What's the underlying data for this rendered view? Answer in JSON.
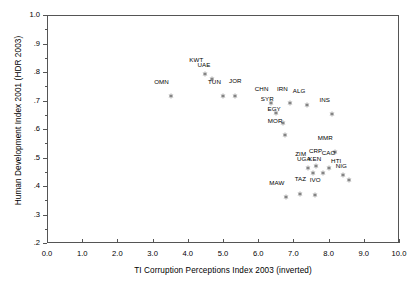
{
  "chart_data": {
    "type": "scatter",
    "title": "",
    "xlabel": "TI Corruption Perceptions Index 2003 (inverted)",
    "ylabel": "Human Development Index 2001 (HDR 2003)",
    "xlim": [
      0.0,
      10.0
    ],
    "ylim": [
      0.2,
      1.0
    ],
    "xticks": [
      "0.0",
      "1.0",
      "2.0",
      "3.0",
      "4.0",
      "5.0",
      "6.0",
      "7.0",
      "8.0",
      "9.0",
      "10.0"
    ],
    "xtick_values": [
      0,
      1,
      2,
      3,
      4,
      5,
      6,
      7,
      8,
      9,
      10
    ],
    "yticks": [
      "1.0",
      ".9",
      ".8",
      ".7",
      ".6",
      ".5",
      ".4",
      ".3",
      ".2"
    ],
    "ytick_values": [
      1.0,
      0.9,
      0.8,
      0.7,
      0.6,
      0.5,
      0.4,
      0.3,
      0.2
    ],
    "grid": false,
    "legend": false,
    "marker": "asterisk-star",
    "marker_color": "#555555",
    "points": [
      {
        "label": "OMN",
        "x": 3.52,
        "y": 0.744,
        "lab": "left"
      },
      {
        "label": "KWT",
        "x": 4.5,
        "y": 0.82,
        "lab": "left"
      },
      {
        "label": "UAE",
        "x": 4.7,
        "y": 0.805,
        "lab": "left"
      },
      {
        "label": "TUN",
        "x": 5.0,
        "y": 0.745,
        "lab": "left"
      },
      {
        "label": "JOR",
        "x": 5.35,
        "y": 0.743,
        "lab": "above"
      },
      {
        "label": "CHN",
        "x": 6.35,
        "y": 0.721,
        "lab": "left"
      },
      {
        "label": "IRN",
        "x": 6.9,
        "y": 0.721,
        "lab": "left"
      },
      {
        "label": "ALG",
        "x": 7.4,
        "y": 0.714,
        "lab": "left"
      },
      {
        "label": "SYR",
        "x": 6.5,
        "y": 0.685,
        "lab": "left"
      },
      {
        "label": "EGY",
        "x": 6.7,
        "y": 0.648,
        "lab": "left"
      },
      {
        "label": "MOR",
        "x": 6.75,
        "y": 0.606,
        "lab": "left"
      },
      {
        "label": "INS",
        "x": 8.1,
        "y": 0.682,
        "lab": "left"
      },
      {
        "label": "MMR",
        "x": 8.18,
        "y": 0.546,
        "lab": "left"
      },
      {
        "label": "CRP",
        "x": 7.63,
        "y": 0.5,
        "lab": "above"
      },
      {
        "label": "CAO",
        "x": 8.0,
        "y": 0.492,
        "lab": "above"
      },
      {
        "label": "ZIM",
        "x": 7.42,
        "y": 0.492,
        "lab": "left"
      },
      {
        "label": "UGA",
        "x": 7.55,
        "y": 0.475,
        "lab": "left"
      },
      {
        "label": "KEN",
        "x": 7.85,
        "y": 0.472,
        "lab": "left"
      },
      {
        "label": "HTI",
        "x": 8.42,
        "y": 0.468,
        "lab": "left"
      },
      {
        "label": "NIG",
        "x": 8.58,
        "y": 0.448,
        "lab": "left"
      },
      {
        "label": "TAZ",
        "x": 7.2,
        "y": 0.4,
        "lab": "above"
      },
      {
        "label": "IVO",
        "x": 7.62,
        "y": 0.396,
        "lab": "above"
      },
      {
        "label": "MAW",
        "x": 6.8,
        "y": 0.389,
        "lab": "left"
      }
    ]
  }
}
